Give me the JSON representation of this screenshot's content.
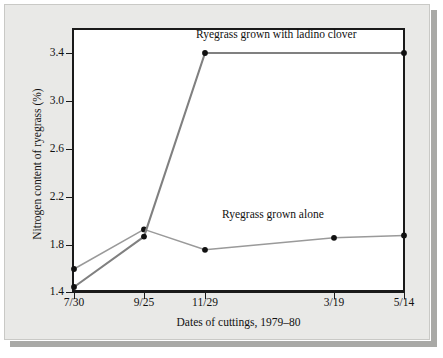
{
  "figure": {
    "background_color": "#e9e9e7",
    "plot_background_color": "#ffffff",
    "frame_color": "#1a1a1a"
  },
  "chart_data": {
    "type": "line",
    "title": "",
    "xlabel": "Dates of cuttings, 1979–80",
    "ylabel": "Nitrogen content of ryegrass (%)",
    "categories": [
      "7/30",
      "9/25",
      "11/29",
      "3/19",
      "5/14"
    ],
    "ylim": [
      1.4,
      3.55
    ],
    "yticks": [
      "1.4",
      "1.8",
      "2.2",
      "2.6",
      "3.0",
      "3.4"
    ],
    "ytick_values": [
      1.4,
      1.8,
      2.2,
      2.6,
      3.0,
      3.4
    ],
    "grid": false,
    "legend": "inline-annotations",
    "series": [
      {
        "name": "Ryegrass grown with ladino clover",
        "color": "#808080",
        "marker": "filled-circle",
        "x": [
          "7/30",
          "9/25",
          "11/29",
          "5/14"
        ],
        "values": [
          1.45,
          1.87,
          3.4,
          3.4
        ]
      },
      {
        "name": "Ryegrass grown alone",
        "color": "#9a9a9a",
        "marker": "filled-circle",
        "x": [
          "7/30",
          "9/25",
          "11/29",
          "3/19",
          "5/14"
        ],
        "values": [
          1.6,
          1.93,
          1.76,
          1.86,
          1.88
        ]
      }
    ],
    "annotations": [
      {
        "text": "Ryegrass grown with ladino clover",
        "near": "11/29-5/14 plateau"
      },
      {
        "text": "Ryegrass grown alone",
        "near": "3/19"
      }
    ]
  },
  "axes": {
    "y_title": "Nitrogen content of ryegrass (%)",
    "x_title": "Dates of cuttings, 1979–80",
    "y_labels": [
      "3.4",
      "3.0",
      "2.6",
      "2.2",
      "1.8",
      "1.4"
    ],
    "x_labels": [
      "7/30",
      "9/25",
      "11/29",
      "3/19",
      "5/14"
    ]
  }
}
